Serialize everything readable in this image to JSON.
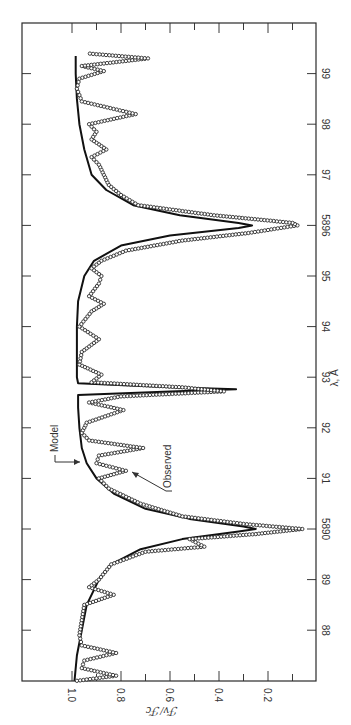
{
  "chart_data": {
    "type": "line",
    "title": "",
    "orientation": "rotated-90-clockwise",
    "xlabel": "λ, Å",
    "ylabel": "ℱν/ℱc",
    "xlim": [
      5887.0,
      5900.0
    ],
    "ylim": [
      0.0,
      1.2
    ],
    "x_ticks": [
      {
        "value": 5888,
        "label": "88"
      },
      {
        "value": 5889,
        "label": "89"
      },
      {
        "value": 5890,
        "label": "5890"
      },
      {
        "value": 5891,
        "label": "91"
      },
      {
        "value": 5892,
        "label": "92"
      },
      {
        "value": 5893,
        "label": "93"
      },
      {
        "value": 5894,
        "label": "94"
      },
      {
        "value": 5895,
        "label": "95"
      },
      {
        "value": 5896,
        "label": "5896"
      },
      {
        "value": 5897,
        "label": "97"
      },
      {
        "value": 5898,
        "label": "98"
      },
      {
        "value": 5899,
        "label": "99"
      }
    ],
    "y_ticks": [
      {
        "value": 1.0,
        "label": "1.0"
      },
      {
        "value": 0.8,
        "label": "0.8"
      },
      {
        "value": 0.6,
        "label": "0.6"
      },
      {
        "value": 0.4,
        "label": "0.4"
      },
      {
        "value": 0.2,
        "label": "0.2"
      }
    ],
    "y_minor_ticks": [
      0.9,
      0.7,
      0.5,
      0.3,
      0.1
    ],
    "grid": false,
    "legend": "none (inline annotations)",
    "annotations": [
      {
        "text": "Model",
        "points_to": "model curve near 5891.3 Å"
      },
      {
        "text": "Observed",
        "points_to": "observed points near 5891.3 Å"
      }
    ],
    "series": [
      {
        "name": "Model",
        "style": "solid line",
        "x": [
          5887.0,
          5887.5,
          5888.0,
          5888.5,
          5889.0,
          5889.3,
          5889.6,
          5889.8,
          5889.95,
          5890.0,
          5890.05,
          5890.2,
          5890.4,
          5890.7,
          5891.0,
          5891.3,
          5891.6,
          5892.0,
          5892.4,
          5892.65,
          5892.72,
          5892.76,
          5892.8,
          5892.88,
          5893.0,
          5893.5,
          5894.0,
          5894.5,
          5895.0,
          5895.3,
          5895.6,
          5895.8,
          5895.95,
          5896.0,
          5896.05,
          5896.2,
          5896.4,
          5896.7,
          5897.0,
          5897.5,
          5898.0,
          5898.5,
          5899.0,
          5899.35
        ],
        "values": [
          0.99,
          0.98,
          0.96,
          0.94,
          0.89,
          0.84,
          0.72,
          0.55,
          0.32,
          0.25,
          0.3,
          0.52,
          0.7,
          0.83,
          0.9,
          0.94,
          0.96,
          0.97,
          0.975,
          0.975,
          0.6,
          0.33,
          0.6,
          0.975,
          0.98,
          0.98,
          0.98,
          0.975,
          0.95,
          0.91,
          0.8,
          0.6,
          0.32,
          0.265,
          0.32,
          0.56,
          0.75,
          0.86,
          0.92,
          0.95,
          0.97,
          0.98,
          0.985,
          0.985
        ]
      },
      {
        "name": "Observed",
        "style": "open circles",
        "x": [
          5887.0,
          5887.1,
          5887.25,
          5887.4,
          5887.55,
          5887.7,
          5887.9,
          5888.2,
          5888.5,
          5888.7,
          5888.85,
          5889.0,
          5889.3,
          5889.55,
          5889.65,
          5889.8,
          5889.9,
          5890.0,
          5890.1,
          5890.25,
          5890.5,
          5890.8,
          5891.0,
          5891.15,
          5891.3,
          5891.45,
          5891.6,
          5891.75,
          5891.9,
          5892.1,
          5892.35,
          5892.5,
          5892.62,
          5892.72,
          5892.8,
          5892.9,
          5893.05,
          5893.25,
          5893.5,
          5893.75,
          5894.0,
          5894.3,
          5894.45,
          5894.6,
          5894.85,
          5895.0,
          5895.15,
          5895.3,
          5895.5,
          5895.7,
          5895.85,
          5895.97,
          5896.0,
          5896.05,
          5896.2,
          5896.4,
          5896.6,
          5896.8,
          5897.0,
          5897.2,
          5897.35,
          5897.5,
          5897.7,
          5897.85,
          5898.0,
          5898.2,
          5898.45,
          5898.7,
          5898.9,
          5899.05,
          5899.15,
          5899.3,
          5899.4
        ],
        "values": [
          0.98,
          0.82,
          0.96,
          0.95,
          0.82,
          0.96,
          0.97,
          0.96,
          0.95,
          0.83,
          0.93,
          0.89,
          0.84,
          0.7,
          0.46,
          0.52,
          0.25,
          0.06,
          0.3,
          0.55,
          0.72,
          0.85,
          0.89,
          0.78,
          0.9,
          0.89,
          0.71,
          0.93,
          0.96,
          0.94,
          0.79,
          0.93,
          0.8,
          0.38,
          0.55,
          0.92,
          0.88,
          0.97,
          0.96,
          0.89,
          0.97,
          0.92,
          0.87,
          0.93,
          0.89,
          0.88,
          0.92,
          0.88,
          0.78,
          0.55,
          0.28,
          0.12,
          0.08,
          0.1,
          0.42,
          0.73,
          0.8,
          0.85,
          0.87,
          0.89,
          0.92,
          0.86,
          0.92,
          0.9,
          0.93,
          0.74,
          0.96,
          0.98,
          0.97,
          0.87,
          0.96,
          0.69,
          0.94
        ]
      }
    ]
  },
  "labels": {
    "x_axis_title": "λ, Å",
    "y_axis_title": "ℱν/ℱc",
    "model_annotation": "Model",
    "observed_annotation": "Observed"
  },
  "layout": {
    "frame": {
      "left": 22,
      "top": 23,
      "right": 316,
      "bottom": 681
    },
    "lambda_top": 5900.0,
    "px_per_angstrom": 50.6,
    "ratio_one_x": 72,
    "px_per_unit_ratio": 245
  },
  "colors": {
    "ink": "#1a1a1a",
    "background": "#ffffff"
  }
}
